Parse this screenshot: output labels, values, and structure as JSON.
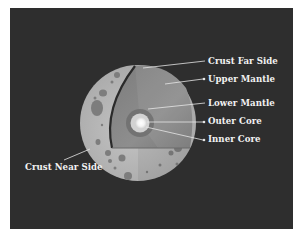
{
  "diagram": {
    "background_color": "#2e2e2e",
    "label_color": "#f2f2f2",
    "labels": [
      {
        "id": "crust-far-side",
        "text": "Crust Far Side",
        "x": 208,
        "y": 56
      },
      {
        "id": "upper-mantle",
        "text": "Upper Mantle",
        "x": 208,
        "y": 74
      },
      {
        "id": "lower-mantle",
        "text": "Lower Mantle",
        "x": 208,
        "y": 98
      },
      {
        "id": "outer-core",
        "text": "Outer Core",
        "x": 208,
        "y": 116
      },
      {
        "id": "inner-core",
        "text": "Inner Core",
        "x": 208,
        "y": 134
      },
      {
        "id": "crust-near-side",
        "text": "Crust Near Side",
        "x": 25,
        "y": 162
      }
    ],
    "layers": {
      "crust_color": "#b9b9b9",
      "crater_color": "#7d7d7d",
      "mantle_color": "#878787",
      "lower_mantle_color": "#6e6e6e",
      "outer_core_color": "#cfcfcf",
      "inner_core_color": "#ffffff"
    }
  }
}
